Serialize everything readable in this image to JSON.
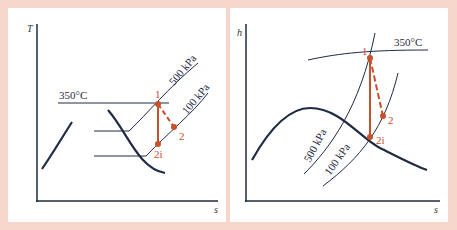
{
  "colors": {
    "background": "#f6d6cb",
    "panel": "#ffffff",
    "curve": "#1f2a44",
    "process": "#c8502a"
  },
  "left_diagram": {
    "y_axis_label": "T",
    "x_axis_label": "s",
    "isotherm_label": "350°C",
    "isobars": [
      {
        "label": "500 kPa"
      },
      {
        "label": "100 kPa"
      }
    ],
    "states": [
      {
        "label": "1"
      },
      {
        "label": "2"
      },
      {
        "label": "2i"
      }
    ]
  },
  "right_diagram": {
    "y_axis_label": "h",
    "x_axis_label": "s",
    "isotherm_label": "350°C",
    "isobars": [
      {
        "label": "500 kPa"
      },
      {
        "label": "100 kPa"
      }
    ],
    "states": [
      {
        "label": "1"
      },
      {
        "label": "2"
      },
      {
        "label": "2i"
      }
    ]
  }
}
